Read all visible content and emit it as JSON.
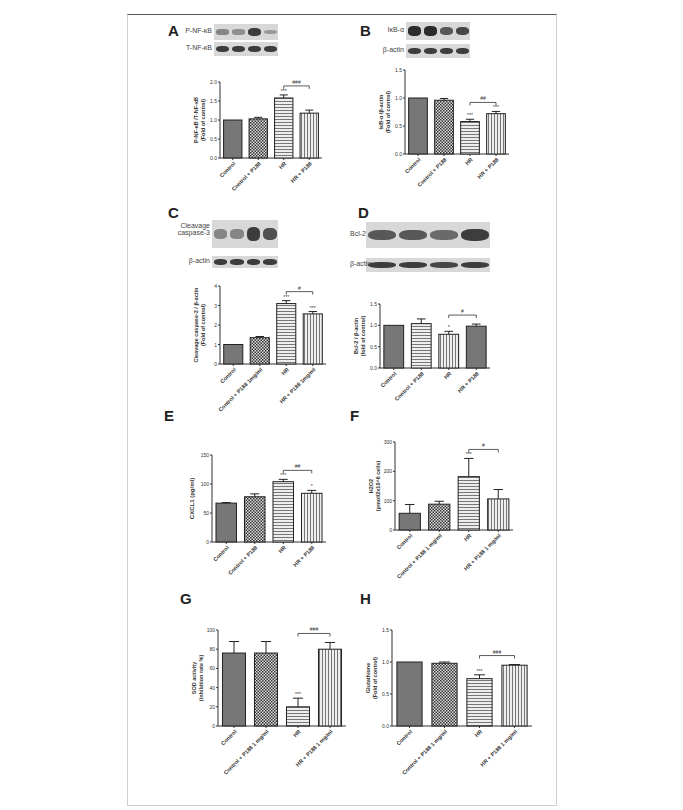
{
  "figure": {
    "panels": [
      {
        "id": "A",
        "blots": [
          {
            "label": "P-NF-κB",
            "intensity": [
              0.45,
              0.4,
              0.85,
              0.35
            ]
          },
          {
            "label": "T-NF-κB",
            "intensity": [
              0.85,
              0.85,
              0.85,
              0.85
            ]
          }
        ]
      },
      {
        "id": "B",
        "blots": [
          {
            "label": "IκB-α",
            "intensity": [
              0.95,
              0.95,
              0.7,
              0.8
            ]
          },
          {
            "label": "β-actin",
            "intensity": [
              0.85,
              0.85,
              0.85,
              0.85
            ]
          }
        ]
      },
      {
        "id": "C",
        "blots": [
          {
            "label": "Cleavage caspase-3",
            "intensity": [
              0.45,
              0.45,
              0.85,
              0.75
            ]
          },
          {
            "label": "β-actin",
            "intensity": [
              0.85,
              0.85,
              0.85,
              0.85
            ]
          }
        ]
      },
      {
        "id": "D",
        "blots": [
          {
            "label": "Bcl-2",
            "intensity": [
              0.7,
              0.7,
              0.6,
              0.85
            ]
          },
          {
            "label": "β-actin",
            "intensity": [
              0.85,
              0.85,
              0.8,
              0.85
            ]
          }
        ]
      },
      {
        "id": "E",
        "blots": []
      },
      {
        "id": "F",
        "blots": []
      },
      {
        "id": "G",
        "blots": []
      },
      {
        "id": "H",
        "blots": []
      }
    ]
  },
  "chart_data": [
    {
      "panel": "A",
      "type": "bar",
      "categories": [
        "Control",
        "Control + P188",
        "HR",
        "HR + P188"
      ],
      "values": [
        1.0,
        1.03,
        1.58,
        1.18
      ],
      "errors": [
        0.0,
        0.04,
        0.08,
        0.08
      ],
      "ylabel": "P-NF-κB /T-NF-κB (Fold of control)",
      "ylim": [
        0,
        2.0
      ],
      "yticks": [
        "0.0",
        "0.5",
        "1.0",
        "1.5",
        "2.0"
      ],
      "annotations": [
        "",
        "",
        "***",
        "###"
      ],
      "bracket": {
        "from": 2,
        "to": 3,
        "label": "###"
      }
    },
    {
      "panel": "B",
      "type": "bar",
      "categories": [
        "Control",
        "Control + P188",
        "HR",
        "HR + P188"
      ],
      "values": [
        1.0,
        0.96,
        0.58,
        0.72
      ],
      "errors": [
        0.0,
        0.03,
        0.04,
        0.04
      ],
      "ylabel": "IκB-α /β-actin (Fold of control)",
      "ylim": [
        0,
        1.5
      ],
      "yticks": [
        "0.0",
        "0.5",
        "1.0",
        "1.5"
      ],
      "annotations": [
        "",
        "",
        "***",
        "***"
      ],
      "bracket": {
        "from": 2,
        "to": 3,
        "label": "##"
      }
    },
    {
      "panel": "C",
      "type": "bar",
      "categories": [
        "Control",
        "Control + P188 1mg/ml",
        "HR",
        "HR + P188 1mg/ml"
      ],
      "values": [
        1.0,
        1.35,
        3.1,
        2.57
      ],
      "errors": [
        0.0,
        0.06,
        0.15,
        0.12
      ],
      "ylabel": "Cleavage caspase-3 / β-actin (Fold of control)",
      "ylim": [
        0,
        4
      ],
      "yticks": [
        "0",
        "1",
        "2",
        "3",
        "4"
      ],
      "annotations": [
        "",
        "",
        "***",
        "***"
      ],
      "bracket": {
        "from": 2,
        "to": 3,
        "label": "#"
      }
    },
    {
      "panel": "D",
      "type": "bar",
      "categories": [
        "Control",
        "Control + P188",
        "HR",
        "HR + P188"
      ],
      "values": [
        1.0,
        1.04,
        0.79,
        0.98
      ],
      "errors": [
        0.0,
        0.11,
        0.07,
        0.05
      ],
      "ylabel": "Bcl-2 / β-actin (fold of control)",
      "ylim": [
        0,
        1.5
      ],
      "yticks": [
        "0.0",
        "0.5",
        "1.0",
        "1.5"
      ],
      "annotations": [
        "",
        "",
        "*",
        ""
      ],
      "bracket": {
        "from": 2,
        "to": 3,
        "label": "#"
      }
    },
    {
      "panel": "E",
      "type": "bar",
      "categories": [
        "Control",
        "Control + P188",
        "HR",
        "HR + P188"
      ],
      "values": [
        67,
        78,
        104,
        84
      ],
      "errors": [
        1,
        5,
        4,
        5
      ],
      "ylabel": "CXCL1 (pg/ml)",
      "ylim": [
        0,
        150
      ],
      "yticks": [
        "0",
        "50",
        "100",
        "150"
      ],
      "annotations": [
        "",
        "",
        "***",
        "*"
      ],
      "bracket": {
        "from": 2,
        "to": 3,
        "label": "##"
      }
    },
    {
      "panel": "F",
      "type": "bar",
      "categories": [
        "Control",
        "Control + P188 1 mg/ml",
        "HR",
        "HR + P188 1 mg/ml"
      ],
      "values": [
        57,
        88,
        182,
        106
      ],
      "errors": [
        30,
        10,
        62,
        32
      ],
      "ylabel": "H2O2 (pmol/2x10^6 cells)",
      "ylim": [
        0,
        300
      ],
      "yticks": [
        "0",
        "100",
        "200",
        "300"
      ],
      "annotations": [
        "",
        "",
        "***",
        ""
      ],
      "bracket": {
        "from": 2,
        "to": 3,
        "label": "#"
      }
    },
    {
      "panel": "G",
      "type": "bar",
      "categories": [
        "Control",
        "Control + P188 1 mg/ml",
        "HR",
        "HR + P188 1 mg/ml"
      ],
      "values": [
        76,
        76,
        20,
        80
      ],
      "errors": [
        12,
        12,
        9,
        7
      ],
      "ylabel": "SOD activity (inhibition rate %)",
      "ylim": [
        0,
        100
      ],
      "yticks": [
        "0",
        "20",
        "40",
        "60",
        "80",
        "100"
      ],
      "annotations": [
        "",
        "",
        "***",
        ""
      ],
      "bracket": {
        "from": 2,
        "to": 3,
        "label": "###"
      }
    },
    {
      "panel": "H",
      "type": "bar",
      "categories": [
        "Control",
        "Control + P188 1 mg/ml",
        "HR",
        "HR + P188 1 mg/ml"
      ],
      "values": [
        1.0,
        0.98,
        0.74,
        0.95
      ],
      "errors": [
        0.0,
        0.02,
        0.06,
        0.01
      ],
      "ylabel": "Glutathione (Fold of control)",
      "ylim": [
        0,
        1.5
      ],
      "yticks": [
        "0.0",
        "0.5",
        "1.0",
        "1.5"
      ],
      "annotations": [
        "",
        "",
        "***",
        ""
      ],
      "bracket": {
        "from": 2,
        "to": 3,
        "label": "###"
      }
    }
  ]
}
